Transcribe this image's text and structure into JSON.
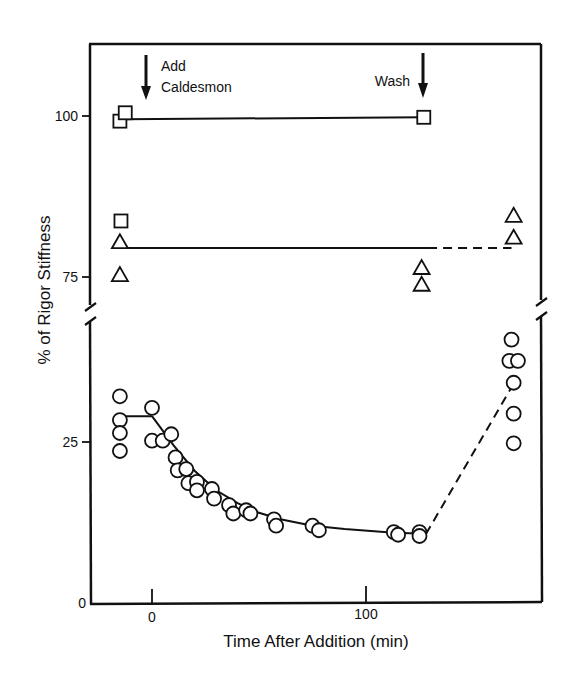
{
  "chart_data": {
    "type": "scatter",
    "title": "",
    "xlabel": "Time After Addition (min)",
    "ylabel": "% of Rigor Stiffness",
    "x_ticks": [
      0,
      100
    ],
    "y_ticks": [
      0,
      25,
      75,
      100
    ],
    "y_axis_break": {
      "from": 50,
      "to": 70
    },
    "xlim": [
      -27,
      183
    ],
    "ylim": [
      0,
      110
    ],
    "grid": false,
    "legend": null,
    "annotations": [
      {
        "text": [
          "Add",
          "Caldesmon"
        ],
        "x": -3,
        "arrow": "down"
      },
      {
        "text": [
          "Wash"
        ],
        "x": 127,
        "arrow": "down"
      }
    ],
    "series": [
      {
        "name": "squares",
        "marker": "square",
        "points": [
          [
            -15,
            99.2
          ],
          [
            -12.5,
            100.5
          ],
          [
            -14.5,
            83.7
          ],
          [
            127,
            99.8
          ]
        ],
        "fit_lines": [
          {
            "style": "solid",
            "from": [
              -13,
              99.5
            ],
            "to": [
              127,
              99.8
            ]
          }
        ]
      },
      {
        "name": "triangles",
        "marker": "triangle",
        "points": [
          [
            -15,
            80.4
          ],
          [
            -15,
            75.3
          ],
          [
            126,
            76.4
          ],
          [
            126,
            73.8
          ],
          [
            169,
            84.5
          ],
          [
            169,
            81.1
          ]
        ],
        "fit_lines": [
          {
            "style": "solid",
            "from": [
              -14,
              79.5
            ],
            "to": [
              129,
              79.5
            ]
          },
          {
            "style": "dashed",
            "from": [
              129,
              79.5
            ],
            "to": [
              168,
              79.5
            ]
          }
        ]
      },
      {
        "name": "circles",
        "marker": "circle",
        "points": [
          [
            -15,
            32.1
          ],
          [
            -15,
            28.4
          ],
          [
            -15,
            26.4
          ],
          [
            -15,
            23.6
          ],
          [
            0,
            30.3
          ],
          [
            0,
            25.2
          ],
          [
            5,
            25.2
          ],
          [
            9,
            26.2
          ],
          [
            11,
            22.6
          ],
          [
            12,
            20.6
          ],
          [
            16,
            20.8
          ],
          [
            17,
            18.6
          ],
          [
            21,
            18.8
          ],
          [
            21,
            17.5
          ],
          [
            28,
            17.7
          ],
          [
            29,
            16.2
          ],
          [
            36,
            15.2
          ],
          [
            38,
            13.9
          ],
          [
            44,
            14.4
          ],
          [
            46,
            13.9
          ],
          [
            57,
            13.0
          ],
          [
            58,
            12.0
          ],
          [
            75,
            12.0
          ],
          [
            78,
            11.3
          ],
          [
            113,
            11.0
          ],
          [
            115,
            10.6
          ],
          [
            125,
            11.0
          ],
          [
            125,
            10.4
          ],
          [
            168,
            40.9
          ],
          [
            167,
            37.6
          ],
          [
            171,
            37.6
          ],
          [
            169,
            34.2
          ],
          [
            169,
            29.4
          ],
          [
            169,
            24.8
          ]
        ],
        "fit_lines": [
          {
            "style": "solid",
            "type": "plateau",
            "from": [
              -15,
              29
            ],
            "to": [
              0,
              29
            ]
          },
          {
            "style": "solid",
            "type": "exp-decay",
            "points": [
              [
                0,
                29
              ],
              [
                10,
                24.5
              ],
              [
                20,
                20.5
              ],
              [
                30,
                17.5
              ],
              [
                40,
                15.5
              ],
              [
                50,
                14
              ],
              [
                60,
                13
              ],
              [
                75,
                12
              ],
              [
                90,
                11.5
              ],
              [
                110,
                11
              ],
              [
                128,
                10.7
              ]
            ]
          },
          {
            "style": "dashed",
            "from": [
              128,
              10.7
            ],
            "to": [
              168,
              33.5
            ]
          }
        ]
      }
    ]
  },
  "labels": {
    "x_title": "Time After Addition (min)",
    "y_title": "% of Rigor Stiffness",
    "x_tick_0": "0",
    "x_tick_100": "100",
    "y_tick_0": "0",
    "y_tick_25": "25",
    "y_tick_75": "75",
    "y_tick_100": "100",
    "annot_add_1": "Add",
    "annot_add_2": "Caldesmon",
    "annot_wash": "Wash"
  }
}
